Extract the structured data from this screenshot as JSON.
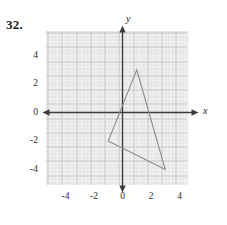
{
  "problem": {
    "number_label": "32."
  },
  "figure": {
    "background_color": "#ffffff",
    "plot_background_color": "#f2f2f2",
    "major_grid_color": "#c9c9c9",
    "minor_grid_color": "#e3e3e3",
    "axis_color": "#3c3c3c",
    "shape_color": "#8a8a8a"
  },
  "chart_data": {
    "type": "scatter",
    "title": "",
    "xlabel": "x",
    "ylabel": "y",
    "xlim": [
      -5,
      5
    ],
    "ylim": [
      -5.4,
      5.4
    ],
    "grid": true,
    "major_grid_step": 1,
    "minor_grid_step": 0.25,
    "legend": "none",
    "x_ticks": [
      -4,
      -2,
      0,
      2,
      4
    ],
    "x_tick_labels": [
      "-4",
      "-2",
      "0",
      "2",
      "4"
    ],
    "y_ticks": [
      4,
      2,
      0,
      -2,
      -4
    ],
    "y_tick_labels": [
      "4",
      "2",
      "0",
      "-2",
      "-4"
    ],
    "axis_arrows": [
      "x-left",
      "x-right",
      "y-up",
      "y-down"
    ],
    "shapes": [
      {
        "name": "triangle",
        "kind": "polygon",
        "closed": true,
        "vertices": [
          {
            "x": 1,
            "y": 3
          },
          {
            "x": 3,
            "y": -4
          },
          {
            "x": -1,
            "y": -2
          }
        ]
      }
    ]
  },
  "axis_names": {
    "x": "x",
    "y": "y"
  },
  "x_tick_labels": [
    "-4",
    "-2",
    "0",
    "2",
    "4"
  ],
  "y_tick_labels": [
    "4",
    "2",
    "0",
    "-2",
    "-4"
  ]
}
